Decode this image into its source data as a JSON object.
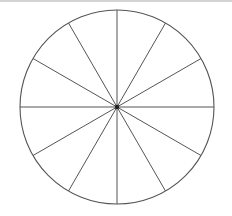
{
  "diagram": {
    "type": "divided-circle",
    "segments": 12,
    "center": [
      117,
      107
    ],
    "radius": 97,
    "stroke_color": "#555555",
    "center_dot_color": "#222222",
    "top_bar_color": "#d4d4d4"
  }
}
